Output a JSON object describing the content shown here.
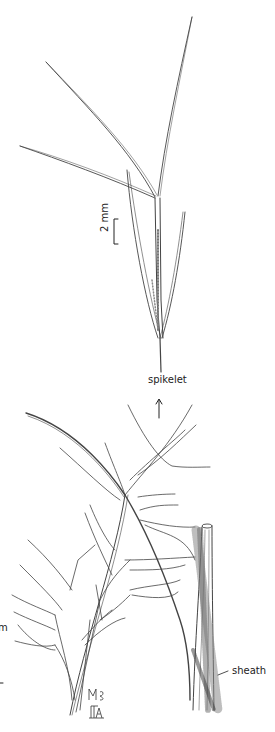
{
  "figure": {
    "type": "botanical line illustration",
    "labels": {
      "scale_bar": "2 mm",
      "spikelet": "spikelet",
      "sheath": "sheath",
      "partial_left_edge": "m"
    },
    "signature": "illustrator monogram",
    "colors": {
      "ink": "#333333",
      "background": "#ffffff"
    }
  }
}
